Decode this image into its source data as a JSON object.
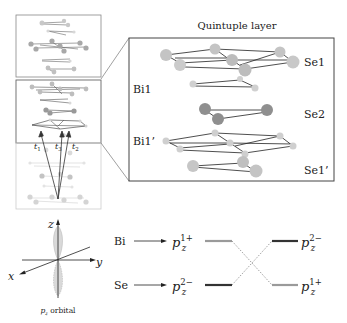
{
  "figure": {
    "quintuple_title": "Quintuple layer",
    "layer_labels": {
      "se1": "Se1",
      "bi1": "Bi1",
      "se2": "Se2",
      "bi1p": "Bi1’",
      "se1p": "Se1’"
    },
    "hopping_labels": [
      "t",
      "t",
      "t"
    ],
    "hopping_subscripts": [
      "1",
      "3",
      "2"
    ],
    "orbital": {
      "axis_z": "z",
      "axis_y": "y",
      "axis_x": "x",
      "caption_main": "p",
      "caption_sub": "z",
      "caption_rest": " orbital"
    },
    "energy_diagram": {
      "left": [
        {
          "atom": "Bi",
          "state": "p",
          "sub": "z",
          "sup": "1+"
        },
        {
          "atom": "Se",
          "state": "p",
          "sub": "z",
          "sup": "2−"
        }
      ],
      "right": [
        {
          "state": "p",
          "sub": "z",
          "sup": "2−"
        },
        {
          "state": "p",
          "sub": "z",
          "sup": "1+"
        }
      ]
    },
    "colors": {
      "bi_atom": "#c8c8c8",
      "se_atom": "#a8a8a8",
      "se2_atom": "#8e8e8e",
      "bond": "#222222",
      "box": "#555555",
      "level_light": "#9a9a9a",
      "level_dark": "#333333"
    }
  }
}
